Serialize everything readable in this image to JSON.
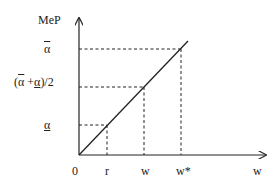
{
  "diagram": {
    "y_axis_label": "MeP",
    "x_axis_label": "w",
    "origin_label": "0",
    "y_ticks": [
      {
        "id": "alpha_bar",
        "label": "α",
        "decoration": "overline"
      },
      {
        "id": "midpoint",
        "label_parts": [
          "(",
          "α",
          " +",
          "α",
          ")/2"
        ],
        "label": "(ᾱ +α)/2"
      },
      {
        "id": "alpha_under",
        "label": "α",
        "decoration": "underline"
      }
    ],
    "x_ticks": [
      {
        "id": "r",
        "label": "r"
      },
      {
        "id": "w",
        "label": "w"
      },
      {
        "id": "w_star",
        "label": "w*"
      }
    ],
    "line": {
      "description": "45-degree line from origin",
      "points": [
        [
          "0",
          "0"
        ],
        [
          "r",
          "α"
        ],
        [
          "w",
          "(ᾱ+α)/2"
        ],
        [
          "w*",
          "ᾱ"
        ]
      ]
    },
    "colors": {
      "stroke": "#222222",
      "background": "#ffffff"
    }
  }
}
